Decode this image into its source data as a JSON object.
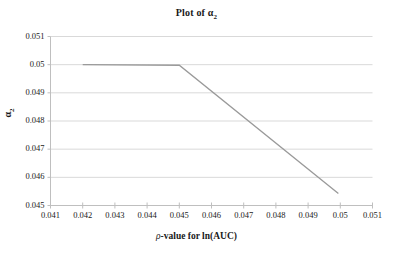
{
  "chart_data": {
    "type": "line",
    "title_main": "Plot of α",
    "title_sub": "2",
    "xlabel": "ρ-value for ln(AUC)",
    "xlabel_prefix": "ρ",
    "xlabel_rest": "-value for ln(AUC)",
    "ylabel": "α₂",
    "ylabel_main": "α",
    "ylabel_sub": "2",
    "xlim": [
      0.041,
      0.051
    ],
    "ylim": [
      0.045,
      0.051
    ],
    "xticks": [
      0.041,
      0.042,
      0.043,
      0.044,
      0.045,
      0.046,
      0.047,
      0.048,
      0.049,
      0.05,
      0.051
    ],
    "yticks": [
      0.045,
      0.046,
      0.047,
      0.048,
      0.049,
      0.05,
      0.051
    ],
    "xtick_labels": [
      "0.041",
      "0.042",
      "0.043",
      "0.044",
      "0.045",
      "0.046",
      "0.047",
      "0.048",
      "0.049",
      "0.05",
      "0.051"
    ],
    "ytick_labels": [
      "0.045",
      "0.046",
      "0.047",
      "0.048",
      "0.049",
      "0.05",
      "0.051"
    ],
    "grid": "horizontal",
    "legend": null,
    "series": [
      {
        "name": "alpha2",
        "color": "#9a9a9a",
        "x": [
          0.042,
          0.045,
          0.04994
        ],
        "values": [
          0.05,
          0.04998,
          0.04543
        ]
      }
    ]
  },
  "style": {
    "line_color": "#9a9a9a",
    "grid_color": "#d9d9d9",
    "axis_color": "#bfbfbf",
    "text_color": "#1a1a1a",
    "background": "#ffffff"
  }
}
